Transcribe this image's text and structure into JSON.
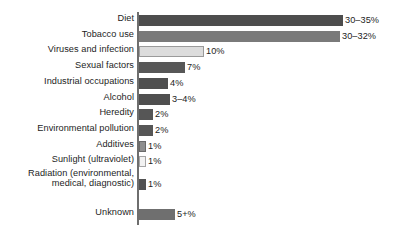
{
  "chart_data": {
    "type": "bar",
    "orientation": "horizontal",
    "title": "",
    "subtitle": "",
    "xlabel": "",
    "ylabel": "",
    "grid": false,
    "legend": null,
    "axis_line": true,
    "xlim": [
      0,
      35
    ],
    "categories": [
      "Diet",
      "Tobacco use",
      "Viruses and infection",
      "Sexual factors",
      "Industrial occupations",
      "Alcohol",
      "Heredity",
      "Environmental pollution",
      "Additives",
      "Sunlight (ultraviolet)",
      "Radiation (environmental,\nmedical, diagnostic)",
      "Unknown"
    ],
    "values": [
      32.5,
      31,
      10,
      7,
      4,
      3.5,
      2,
      2,
      1,
      1,
      1,
      5
    ],
    "value_labels": [
      "30–35%",
      "30–32%",
      "10%",
      "7%",
      "4%",
      "3–4%",
      "2%",
      "2%",
      "1%",
      "1%",
      "1%",
      "5+%"
    ],
    "bars": [
      {
        "label": "Diet",
        "value_label": "30–35%",
        "pixel_width": 204,
        "fill": "#4d4d4d",
        "stroke": "#4d4d4d"
      },
      {
        "label": "Tobacco use",
        "value_label": "30–32%",
        "pixel_width": 201,
        "fill": "#7a7a7a",
        "stroke": "#7a7a7a"
      },
      {
        "label": "Viruses and infection",
        "value_label": "10%",
        "pixel_width": 65,
        "fill": "#dcdcdc",
        "stroke": "#9a9a9a"
      },
      {
        "label": "Sexual factors",
        "value_label": "7%",
        "pixel_width": 46,
        "fill": "#575757",
        "stroke": "#575757"
      },
      {
        "label": "Industrial occupations",
        "value_label": "4%",
        "pixel_width": 29,
        "fill": "#4f4f4f",
        "stroke": "#4f4f4f"
      },
      {
        "label": "Alcohol",
        "value_label": "3–4%",
        "pixel_width": 31,
        "fill": "#4f4f4f",
        "stroke": "#4f4f4f"
      },
      {
        "label": "Heredity",
        "value_label": "2%",
        "pixel_width": 14,
        "fill": "#565656",
        "stroke": "#565656"
      },
      {
        "label": "Environmental pollution",
        "value_label": "2%",
        "pixel_width": 14,
        "fill": "#565656",
        "stroke": "#565656"
      },
      {
        "label": "Additives",
        "value_label": "1%",
        "pixel_width": 7,
        "fill": "#8f8f8f",
        "stroke": "#6a6a6a"
      },
      {
        "label": "Sunlight (ultraviolet)",
        "value_label": "1%",
        "pixel_width": 7,
        "fill": "#f2f2f2",
        "stroke": "#a5a5a5"
      },
      {
        "label": "Radiation (environmental, medical, diagnostic)",
        "value_label": "1%",
        "pixel_width": 7,
        "fill": "#525252",
        "stroke": "#525252"
      },
      {
        "label": "Unknown",
        "value_label": "5+%",
        "pixel_width": 36,
        "fill": "#6f6f6f",
        "stroke": "#6f6f6f"
      }
    ],
    "colors": {
      "background": "#ffffff",
      "text": "#1d1d1d",
      "axis": "#6e6e6e",
      "bar_dark": "#4d4d4d",
      "bar_medium": "#7a7a7a",
      "bar_light": "#dcdcdc",
      "bar_lightest": "#f2f2f2"
    }
  }
}
